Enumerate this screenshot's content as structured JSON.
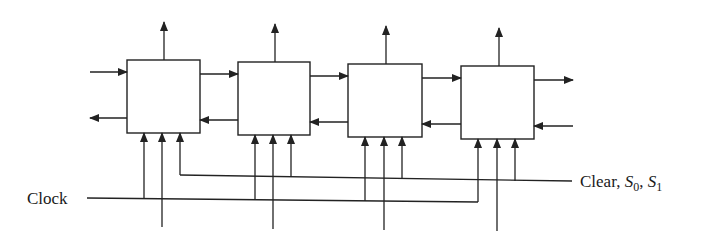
{
  "diagram": {
    "type": "bidirectional shift register (4 stages)",
    "stages": [
      {
        "id": "stage-1",
        "x": 127,
        "y": 60,
        "w": 73,
        "h": 73
      },
      {
        "id": "stage-2",
        "x": 238,
        "y": 62,
        "w": 72,
        "h": 73
      },
      {
        "id": "stage-3",
        "x": 348,
        "y": 64,
        "w": 74,
        "h": 73
      },
      {
        "id": "stage-4",
        "x": 461,
        "y": 66,
        "w": 73,
        "h": 73
      }
    ],
    "labels": {
      "clock": "Clock",
      "clear_prefix": "Clear, ",
      "s0_main": "S",
      "s0_sub": "0",
      "sep": ", ",
      "s1_main": "S",
      "s1_sub": "1"
    }
  }
}
